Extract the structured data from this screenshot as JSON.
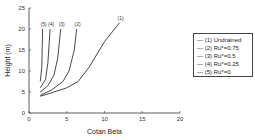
{
  "chart_data": {
    "type": "line",
    "title": "",
    "xlabel": "Cotan Beta",
    "ylabel": "Height (m)",
    "xlim": [
      0,
      20
    ],
    "ylim": [
      0,
      25
    ],
    "xticks": [
      0,
      5,
      10,
      15,
      20
    ],
    "yticks": [
      0,
      5,
      10,
      15,
      20,
      25
    ],
    "grid": false,
    "legend_position": "right",
    "series": [
      {
        "name": "(1) Undrained",
        "tag": "(1)",
        "points": [
          [
            1.5,
            4
          ],
          [
            3,
            4.8
          ],
          [
            5,
            6
          ],
          [
            6.5,
            7.5
          ],
          [
            8,
            11
          ],
          [
            10,
            17
          ],
          [
            12,
            21.5
          ]
        ]
      },
      {
        "name": "(2) Ru*=0.75",
        "tag": "(2)",
        "points": [
          [
            1.5,
            4.2
          ],
          [
            3,
            5.5
          ],
          [
            4.5,
            7.5
          ],
          [
            5.3,
            10
          ],
          [
            6,
            15
          ],
          [
            6.3,
            20
          ]
        ]
      },
      {
        "name": "(3) Ru*=0.5",
        "tag": "(3)",
        "points": [
          [
            1.5,
            5
          ],
          [
            2.5,
            6.5
          ],
          [
            3.3,
            9
          ],
          [
            3.8,
            13
          ],
          [
            4.2,
            20
          ]
        ]
      },
      {
        "name": "(4) Ru*=0.25",
        "tag": "(4)",
        "points": [
          [
            1.5,
            6
          ],
          [
            2.2,
            8
          ],
          [
            2.5,
            12
          ],
          [
            2.8,
            20
          ]
        ]
      },
      {
        "name": "(5) Ru*=0",
        "tag": "(5)",
        "points": [
          [
            1.5,
            7.5
          ],
          [
            1.7,
            11
          ],
          [
            1.8,
            20
          ]
        ]
      }
    ]
  },
  "legend": [
    "— (1) Undrained",
    "— (2) Ru*=0.75",
    "— (3) Ru*=0.5",
    "— (4) Ru*=0.25",
    "— (5) Ru*=0"
  ]
}
